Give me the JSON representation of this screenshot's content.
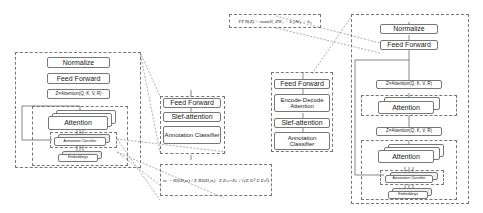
{
  "left_block": {
    "normalize": "Normalize",
    "feed_forward": "Feed Forward",
    "z_attention": "Z=Attention(Q, K, V, R)",
    "attention": "Attention",
    "annotation_classifier": "Annotation Classifier",
    "embeddings": "Embeddings"
  },
  "encoder_zoom": {
    "feed_forward": "Feed Forward",
    "self_attention": "Slef-attention",
    "annotation_classifier": "Annotation Classifier"
  },
  "decoder_zoom": {
    "feed_forward": "Feed Forward",
    "encode_decode_attention": "Encode-Decode Attention",
    "self_attention": "Slef-attention",
    "annotation_classifier": "Annotation Classifier"
  },
  "formulas": {
    "ffn": "FFN(Z) = max(0, ZW₁ + b₁)W₂ + b₂",
    "weight": "wᵢ = RS(D,σᵢ) / Σ RS(D,σᵢ) · Σ Eᵢₖ×Eₖ / √(Σ Eᵢ² Σ Eₖ²)"
  },
  "right_block": {
    "normalize": "Normalize",
    "feed_forward": "Feed Forward",
    "z_attention_top": "Z=Attention(Q, K, V, R)",
    "attention_top": "Attention",
    "z_attention_bottom": "Z=Attention(Q, K, V, R)",
    "attention_bottom": "Attention",
    "annotation_classifier": "Annotation Classifier",
    "embeddings": "Embeddings"
  }
}
